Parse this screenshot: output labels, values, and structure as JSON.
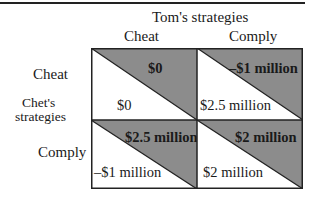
{
  "title": "Tom's strategies",
  "columns": [
    "Cheat",
    "Comply"
  ],
  "row_axis_label_line1": "Chet's",
  "row_axis_label_line2": "strategies",
  "rows": [
    "Cheat",
    "Comply"
  ],
  "colors": {
    "shade": "#8c8c8c",
    "border": "#222222",
    "background": "#ffffff"
  },
  "cells": [
    {
      "row": "Cheat",
      "col": "Cheat",
      "tom_payoff": "$0",
      "chet_payoff": "$0"
    },
    {
      "row": "Cheat",
      "col": "Comply",
      "tom_payoff": "–$1 million",
      "chet_payoff": "$2.5 million"
    },
    {
      "row": "Comply",
      "col": "Cheat",
      "tom_payoff": "$2.5 million",
      "chet_payoff": "–$1 million"
    },
    {
      "row": "Comply",
      "col": "Comply",
      "tom_payoff": "$2 million",
      "chet_payoff": "$2 million"
    }
  ]
}
